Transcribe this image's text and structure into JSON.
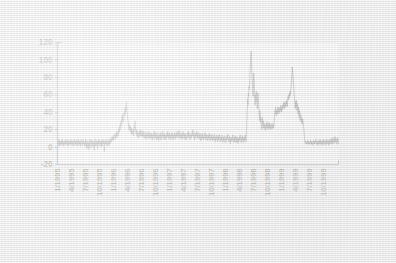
{
  "chart_data": {
    "type": "line",
    "title": "",
    "subtitle": "",
    "xlabel": "",
    "ylabel": "",
    "ylim": [
      -20,
      120
    ],
    "y_ticks": [
      -20,
      0,
      20,
      40,
      60,
      80,
      100,
      120
    ],
    "grid": true,
    "legend": "none",
    "x_axis_type": "date",
    "x_tick_labels": [
      "1/1995",
      "4/1995",
      "7/1995",
      "10/1995",
      "1/1996",
      "4/1996",
      "7/1996",
      "10/1996",
      "1/1997",
      "4/1997",
      "7/1997",
      "10/1997",
      "1/1998",
      "4/1998",
      "7/1998",
      "10/1998",
      "1/1999",
      "4/1999",
      "7/1999",
      "10/1999"
    ],
    "x_tick_rotation_degrees": 90,
    "x_range_start": "1/1995",
    "x_range_end": "12/1999",
    "series_name": "",
    "series_color": "#1c1c1c",
    "annotations": [],
    "notable_peaks": [
      {
        "label": "10/1995",
        "value": 52
      },
      {
        "label": "11/1997",
        "value": 110
      },
      {
        "label": "12/1997",
        "value": 85
      },
      {
        "label": "10/1998",
        "value": 92
      }
    ],
    "values": [
      6,
      3,
      8,
      2,
      5,
      9,
      1,
      6,
      4,
      7,
      2,
      8,
      3,
      5,
      9,
      2,
      6,
      1,
      7,
      4,
      3,
      8,
      5,
      2,
      7,
      4,
      9,
      3,
      6,
      1,
      5,
      8,
      2,
      7,
      3,
      6,
      4,
      9,
      2,
      5,
      7,
      3,
      8,
      1,
      6,
      4,
      2,
      9,
      5,
      3,
      7,
      2,
      8,
      4,
      6,
      1,
      5,
      9,
      3,
      7,
      2,
      6,
      4,
      8,
      1,
      5,
      3,
      7,
      9,
      2,
      6,
      4,
      8,
      3,
      5,
      1,
      7,
      2,
      9,
      4,
      0,
      6,
      -2,
      5,
      8,
      1,
      4,
      -3,
      7,
      2,
      6,
      9,
      3,
      -1,
      5,
      8,
      2,
      6,
      4,
      0,
      7,
      3,
      -4,
      6,
      9,
      2,
      5,
      1,
      8,
      3,
      6,
      -2,
      7,
      4,
      9,
      2,
      5,
      8,
      1,
      6,
      3,
      7,
      0,
      5,
      9,
      2,
      6,
      4,
      8,
      1,
      -5,
      7,
      3,
      6,
      9,
      2,
      5,
      8,
      4,
      1,
      6,
      3,
      9,
      2,
      7,
      5,
      8,
      4,
      10,
      6,
      9,
      12,
      8,
      11,
      7,
      13,
      9,
      12,
      15,
      10,
      13,
      9,
      16,
      12,
      18,
      14,
      11,
      17,
      13,
      20,
      16,
      22,
      18,
      25,
      20,
      28,
      24,
      31,
      27,
      35,
      30,
      38,
      33,
      29,
      34,
      40,
      36,
      44,
      38,
      46,
      42,
      52,
      45,
      40,
      36,
      32,
      28,
      24,
      20,
      26,
      22,
      18,
      24,
      20,
      16,
      22,
      14,
      19,
      15,
      21,
      17,
      13,
      18,
      24,
      20,
      30,
      22,
      18,
      14,
      20,
      16,
      12,
      18,
      14,
      10,
      16,
      12,
      18,
      14,
      20,
      16,
      12,
      17,
      13,
      19,
      15,
      11,
      16,
      12,
      18,
      14,
      10,
      15,
      11,
      17,
      13,
      9,
      14,
      10,
      16,
      12,
      18,
      14,
      10,
      15,
      11,
      17,
      13,
      9,
      15,
      11,
      16,
      12,
      8,
      14,
      10,
      16,
      12,
      18,
      13,
      9,
      15,
      11,
      17,
      12,
      8,
      14,
      10,
      16,
      11,
      7,
      13,
      9,
      15,
      11,
      17,
      12,
      8,
      14,
      10,
      16,
      12,
      18,
      13,
      9,
      15,
      10,
      16,
      12,
      8,
      14,
      9,
      15,
      11,
      17,
      12,
      18,
      13,
      9,
      15,
      11,
      16,
      12,
      8,
      14,
      10,
      16,
      11,
      17,
      12,
      8,
      14,
      10,
      15,
      11,
      17,
      13,
      9,
      15,
      11,
      16,
      12,
      18,
      14,
      10,
      16,
      12,
      19,
      14,
      10,
      15,
      11,
      17,
      13,
      9,
      14,
      10,
      16,
      12,
      18,
      13,
      9,
      15,
      11,
      16,
      12,
      8,
      13,
      9,
      15,
      11,
      17,
      12,
      18,
      14,
      10,
      16,
      12,
      8,
      14,
      10,
      15,
      11,
      17,
      13,
      20,
      15,
      11,
      17,
      12,
      8,
      14,
      10,
      16,
      12,
      18,
      14,
      10,
      15,
      11,
      17,
      13,
      9,
      14,
      10,
      16,
      11,
      7,
      13,
      9,
      15,
      10,
      16,
      12,
      8,
      13,
      9,
      15,
      11,
      17,
      12,
      8,
      14,
      10,
      15,
      11,
      7,
      13,
      9,
      14,
      10,
      16,
      11,
      7,
      12,
      8,
      14,
      10,
      15,
      11,
      7,
      12,
      8,
      13,
      9,
      15,
      10,
      6,
      11,
      7,
      13,
      9,
      14,
      10,
      6,
      12,
      8,
      13,
      9,
      15,
      10,
      6,
      11,
      7,
      12,
      8,
      14,
      9,
      5,
      11,
      7,
      12,
      8,
      13,
      9,
      5,
      10,
      6,
      12,
      8,
      13,
      9,
      15,
      10,
      6,
      11,
      7,
      13,
      8,
      4,
      10,
      6,
      11,
      7,
      12,
      8,
      14,
      9,
      5,
      10,
      6,
      12,
      7,
      13,
      9,
      5,
      11,
      6,
      12,
      8,
      4,
      10,
      6,
      11,
      7,
      13,
      8,
      14,
      9,
      5,
      10,
      6,
      12,
      8,
      13,
      9,
      5,
      11,
      7,
      12,
      8,
      14,
      10,
      6,
      18,
      30,
      42,
      55,
      48,
      62,
      58,
      70,
      66,
      80,
      88,
      96,
      104,
      110,
      98,
      86,
      74,
      66,
      58,
      72,
      85,
      76,
      64,
      56,
      48,
      60,
      52,
      64,
      58,
      50,
      44,
      56,
      62,
      54,
      46,
      38,
      30,
      42,
      36,
      28,
      34,
      26,
      20,
      28,
      34,
      26,
      22,
      30,
      25,
      21,
      27,
      23,
      19,
      25,
      21,
      27,
      23,
      29,
      24,
      20,
      26,
      22,
      28,
      23,
      21,
      27,
      22,
      20,
      26,
      21,
      22,
      27,
      23,
      21,
      26,
      22,
      24,
      30,
      36,
      42,
      38,
      46,
      40,
      36,
      42,
      38,
      44,
      40,
      46,
      42,
      38,
      44,
      40,
      46,
      42,
      48,
      44,
      40,
      46,
      42,
      48,
      44,
      50,
      46,
      52,
      48,
      44,
      50,
      46,
      52,
      48,
      54,
      50,
      46,
      52,
      58,
      54,
      60,
      56,
      62,
      58,
      64,
      60,
      66,
      72,
      78,
      84,
      92,
      86,
      80,
      74,
      68,
      62,
      56,
      50,
      44,
      52,
      46,
      54,
      48,
      42,
      50,
      44,
      38,
      46,
      40,
      34,
      42,
      36,
      30,
      38,
      32,
      28,
      34,
      30,
      26,
      32,
      28,
      24,
      20,
      14,
      10,
      6,
      4,
      7,
      5,
      3,
      6,
      4,
      8,
      5,
      3,
      7,
      4,
      6,
      3,
      5,
      8,
      4,
      6,
      3,
      7,
      5,
      2,
      6,
      4,
      8,
      5,
      3,
      7,
      4,
      6,
      9,
      5,
      3,
      7,
      4,
      6,
      2,
      8,
      5,
      3,
      7,
      4,
      9,
      6,
      3,
      7,
      5,
      2,
      8,
      4,
      6,
      3,
      9,
      5,
      7,
      4,
      2,
      8,
      5,
      3,
      6,
      9,
      4,
      7,
      5,
      2,
      8,
      6,
      3,
      9,
      5,
      7,
      4,
      10,
      6,
      3,
      8,
      5,
      11,
      7,
      4,
      9,
      6,
      12,
      8,
      5,
      10,
      7,
      3,
      9,
      6,
      11,
      7,
      4
    ]
  }
}
